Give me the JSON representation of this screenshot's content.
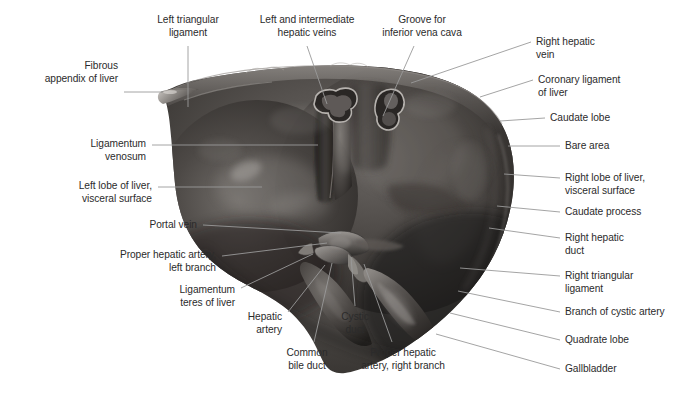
{
  "figure": {
    "background_color": "#ffffff",
    "text_color": "#2b2b2b",
    "leader_line_color": "#9a9a9a",
    "width": 688,
    "height": 405
  },
  "labels": [
    {
      "id": "fibrous-appendix-of-liver",
      "text": "Fibrous\nappendix of liver",
      "align": "r",
      "x": 118,
      "y": 60,
      "leader": [
        [
          124,
          92
        ],
        [
          163,
          92
        ]
      ]
    },
    {
      "id": "left-triangular-ligament",
      "text": "Left triangular\nligament",
      "align": "c",
      "x": 188,
      "y": 14,
      "leader": [
        [
          188,
          46
        ],
        [
          188,
          107
        ]
      ]
    },
    {
      "id": "left-and-intermediate-hepatic-veins",
      "text": "Left and intermediate\nhepatic veins",
      "align": "c",
      "x": 307,
      "y": 14,
      "leader": [
        [
          307,
          46
        ],
        [
          327,
          104
        ]
      ]
    },
    {
      "id": "groove-for-inferior-vena-cava",
      "text": "Groove for\ninferior vena cava",
      "align": "c",
      "x": 422,
      "y": 14,
      "leader": [
        [
          414,
          46
        ],
        [
          383,
          116
        ]
      ]
    },
    {
      "id": "right-hepatic-vein",
      "text": "Right hepatic\nvein",
      "align": "l",
      "x": 536,
      "y": 36,
      "leader": [
        [
          531,
          42
        ],
        [
          411,
          83
        ]
      ]
    },
    {
      "id": "coronary-ligament-of-liver",
      "text": "Coronary ligament\nof liver",
      "align": "l",
      "x": 538,
      "y": 74,
      "leader": [
        [
          533,
          80
        ],
        [
          480,
          97
        ]
      ]
    },
    {
      "id": "caudate-lobe",
      "text": "Caudate lobe",
      "align": "l",
      "x": 550,
      "y": 112,
      "leader": [
        [
          545,
          118
        ],
        [
          500,
          121
        ]
      ]
    },
    {
      "id": "bare-area",
      "text": "Bare area",
      "align": "l",
      "x": 565,
      "y": 140,
      "leader": [
        [
          560,
          146
        ],
        [
          508,
          146
        ]
      ]
    },
    {
      "id": "right-lobe-of-liver-visceral-surface",
      "text": "Right lobe of liver,\nvisceral surface",
      "align": "l",
      "x": 565,
      "y": 172,
      "leader": [
        [
          560,
          178
        ],
        [
          504,
          174
        ]
      ]
    },
    {
      "id": "caudate-process",
      "text": "Caudate process",
      "align": "l",
      "x": 565,
      "y": 206,
      "leader": [
        [
          560,
          212
        ],
        [
          497,
          206
        ]
      ]
    },
    {
      "id": "right-hepatic-duct",
      "text": "Right hepatic\nduct",
      "align": "l",
      "x": 565,
      "y": 232,
      "leader": [
        [
          560,
          238
        ],
        [
          489,
          228
        ]
      ]
    },
    {
      "id": "right-triangular-ligament",
      "text": "Right triangular\nligament",
      "align": "l",
      "x": 565,
      "y": 270,
      "leader": [
        [
          560,
          276
        ],
        [
          460,
          268
        ]
      ]
    },
    {
      "id": "branch-of-cystic-artery",
      "text": "Branch of cystic artery",
      "align": "l",
      "x": 565,
      "y": 306,
      "leader": [
        [
          560,
          312
        ],
        [
          458,
          291
        ]
      ]
    },
    {
      "id": "quadrate-lobe",
      "text": "Quadrate lobe",
      "align": "l",
      "x": 565,
      "y": 334,
      "leader": [
        [
          560,
          340
        ],
        [
          450,
          313
        ]
      ]
    },
    {
      "id": "gallbladder",
      "text": "Gallbladder",
      "align": "l",
      "x": 565,
      "y": 363,
      "leader": [
        [
          560,
          369
        ],
        [
          436,
          334
        ]
      ]
    },
    {
      "id": "ligamentum-venosum",
      "text": "Ligamentum\nvenosum",
      "align": "r",
      "x": 146,
      "y": 138,
      "leader": [
        [
          152,
          145
        ],
        [
          318,
          145
        ]
      ]
    },
    {
      "id": "left-lobe-of-liver-visceral-surface",
      "text": "Left lobe of liver,\nvisceral surface",
      "align": "r",
      "x": 152,
      "y": 180,
      "leader": [
        [
          158,
          187
        ],
        [
          262,
          187
        ]
      ]
    },
    {
      "id": "portal-vein",
      "text": "Portal vein",
      "align": "r",
      "x": 197,
      "y": 219,
      "leader": [
        [
          203,
          225
        ],
        [
          341,
          233
        ]
      ]
    },
    {
      "id": "proper-hepatic-artery-left-branch",
      "text": "Proper hepatic artery,\nleft branch",
      "align": "r",
      "x": 216,
      "y": 249,
      "leader": [
        [
          222,
          256
        ],
        [
          327,
          243
        ]
      ]
    },
    {
      "id": "ligamentum-teres-of-liver",
      "text": "Ligamentum\nteres of liver",
      "align": "r",
      "x": 235,
      "y": 284,
      "leader": [
        [
          241,
          288
        ],
        [
          313,
          254
        ]
      ]
    },
    {
      "id": "hepatic-artery",
      "text": "Hepatic\nartery",
      "align": "r",
      "x": 282,
      "y": 311,
      "leader": [
        [
          288,
          312
        ],
        [
          325,
          265
        ]
      ]
    },
    {
      "id": "common-bile-duct",
      "text": "Common\nbile duct",
      "align": "c",
      "x": 307,
      "y": 347,
      "leader": [
        [
          314,
          342
        ],
        [
          332,
          263
        ]
      ]
    },
    {
      "id": "cystic-duct",
      "text": "Cystic\nduct",
      "align": "c",
      "x": 355,
      "y": 311,
      "leader": [
        [
          355,
          306
        ],
        [
          351,
          257
        ]
      ]
    },
    {
      "id": "proper-hepatic-artery-right-branch",
      "text": "Proper hepatic\nartery, right branch",
      "align": "c",
      "x": 403,
      "y": 347,
      "leader": [
        [
          392,
          342
        ],
        [
          364,
          264
        ]
      ]
    }
  ],
  "illustration": {
    "subject": "liver",
    "view": "visceral surface",
    "structures": [
      "left lobe",
      "right lobe",
      "caudate lobe",
      "quadrate lobe",
      "gallbladder",
      "porta hepatis",
      "groove for inferior vena cava",
      "hepatic vein openings",
      "fibrous appendix",
      "bare area"
    ]
  }
}
